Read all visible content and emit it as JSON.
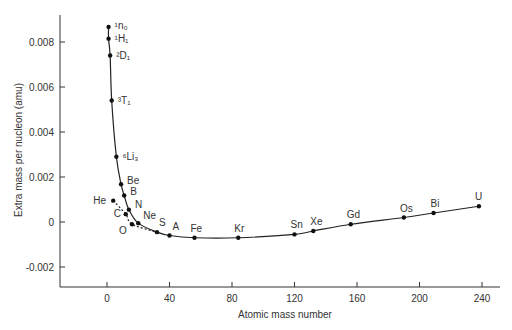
{
  "chart_data": {
    "type": "line",
    "title": "",
    "xlabel": "Atomic mass number",
    "ylabel": "Extra mass per nucleon (amu)",
    "xlim": [
      -30,
      250
    ],
    "ylim": [
      -0.0028,
      0.0093
    ],
    "xticks": [
      0,
      40,
      80,
      120,
      160,
      200,
      240
    ],
    "yticks": [
      -0.002,
      0,
      0.002,
      0.004,
      0.006,
      0.008
    ],
    "ytick_labels": [
      "-0.002",
      "0",
      "0.002",
      "0.004",
      "0.006",
      "0.008"
    ],
    "grid": false,
    "series": [
      {
        "name": "main curve",
        "style": "solid",
        "points": [
          {
            "label": "¹n₀",
            "x": 1,
            "y": 0.00867
          },
          {
            "label": "¹H₁",
            "x": 1,
            "y": 0.00815
          },
          {
            "label": "²D₁",
            "x": 2,
            "y": 0.0074
          },
          {
            "label": "³T₁",
            "x": 3,
            "y": 0.0054
          },
          {
            "label": "⁶Li₃",
            "x": 6,
            "y": 0.0029
          },
          {
            "label": "Be",
            "x": 9,
            "y": 0.00168
          },
          {
            "label": "B",
            "x": 11,
            "y": 0.00118
          },
          {
            "label": "N",
            "x": 14,
            "y": 0.00055
          },
          {
            "label": "Ne",
            "x": 20,
            "y": -5e-05
          },
          {
            "label": "S",
            "x": 32,
            "y": -0.00045
          },
          {
            "label": "A",
            "x": 40,
            "y": -0.0006
          },
          {
            "label": "Fe",
            "x": 56,
            "y": -0.0007
          },
          {
            "label": "Kr",
            "x": 84,
            "y": -0.0007
          },
          {
            "label": "Sn",
            "x": 120,
            "y": -0.00055
          },
          {
            "label": "Xe",
            "x": 132,
            "y": -0.0004
          },
          {
            "label": "Gd",
            "x": 156,
            "y": -0.0001
          },
          {
            "label": "Os",
            "x": 190,
            "y": 0.0002
          },
          {
            "label": "Bi",
            "x": 209,
            "y": 0.0004
          },
          {
            "label": "U",
            "x": 238,
            "y": 0.0007
          }
        ]
      },
      {
        "name": "alpha-type nuclei",
        "style": "dashed",
        "points": [
          {
            "label": "He",
            "x": 4,
            "y": 0.00095
          },
          {
            "label": "C",
            "x": 12,
            "y": 0.00035
          },
          {
            "label": "O",
            "x": 16,
            "y": -0.0001
          },
          {
            "label": "",
            "x": 32,
            "y": -0.00045
          }
        ]
      }
    ]
  }
}
